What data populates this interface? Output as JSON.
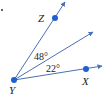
{
  "diagram": {
    "type": "angle-diagram",
    "colors": {
      "ray": "#4a6fb5",
      "point": "#1f5fd1",
      "text": "#222222"
    },
    "vertex": {
      "label": "Y",
      "x": 14,
      "y": 80
    },
    "points": [
      {
        "label": "Z",
        "x": 55,
        "y": 18
      },
      {
        "label": "X",
        "x": 86,
        "y": 69
      }
    ],
    "rays": [
      {
        "name": "ray-YZ",
        "end_x": 65,
        "end_y": 2
      },
      {
        "name": "ray-middle",
        "end_x": 93,
        "end_y": 32
      },
      {
        "name": "ray-YX",
        "end_x": 102,
        "end_y": 66
      }
    ],
    "angles": [
      {
        "label": "48°",
        "between": "ray-YZ and ray-middle"
      },
      {
        "label": "22°",
        "between": "ray-middle and ray-YX"
      }
    ]
  }
}
